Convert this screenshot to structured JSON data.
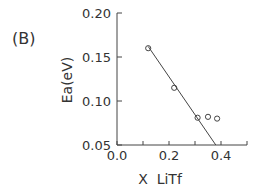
{
  "panel_label": "(B)",
  "chart_data": {
    "type": "scatter",
    "title": "",
    "xlabel": "X  LiTf",
    "ylabel": "Ea(eV)",
    "xlim": [
      0.0,
      0.5
    ],
    "ylim": [
      0.05,
      0.2
    ],
    "xticks": [
      "0.0",
      "0.2",
      "0.4"
    ],
    "yticks": [
      "0.05",
      "0.10",
      "0.15",
      "0.20"
    ],
    "grid": false,
    "series": [
      {
        "name": "data",
        "marker": "open-circle",
        "x": [
          0.12,
          0.22,
          0.31,
          0.35,
          0.385
        ],
        "y": [
          0.16,
          0.115,
          0.081,
          0.082,
          0.08
        ]
      },
      {
        "name": "linear fit",
        "marker": "line",
        "x": [
          0.12,
          0.38
        ],
        "y": [
          0.162,
          0.05
        ]
      }
    ]
  }
}
